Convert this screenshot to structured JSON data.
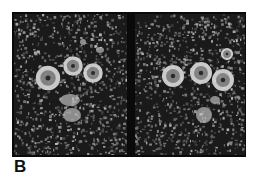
{
  "figure": {
    "panel_label": "B",
    "panels": [
      {
        "id": "left",
        "description": "negative-stain electron micrograph",
        "rings": [
          {
            "cx": 34,
            "cy": 64,
            "r": 10
          },
          {
            "cx": 59,
            "cy": 52,
            "r": 8
          },
          {
            "cx": 79,
            "cy": 59,
            "r": 8
          }
        ],
        "blobs": [
          {
            "cx": 58,
            "cy": 101,
            "rx": 9,
            "ry": 7
          },
          {
            "cx": 56,
            "cy": 86,
            "rx": 10,
            "ry": 6
          },
          {
            "cx": 69,
            "cy": 28,
            "rx": 3,
            "ry": 3
          },
          {
            "cx": 86,
            "cy": 36,
            "rx": 4,
            "ry": 3
          }
        ]
      },
      {
        "id": "right",
        "description": "negative-stain electron micrograph",
        "rings": [
          {
            "cx": 38,
            "cy": 62,
            "r": 9
          },
          {
            "cx": 66,
            "cy": 59,
            "r": 9
          },
          {
            "cx": 88,
            "cy": 66,
            "r": 9
          },
          {
            "cx": 92,
            "cy": 40,
            "r": 5
          }
        ],
        "blobs": [
          {
            "cx": 69,
            "cy": 101,
            "rx": 8,
            "ry": 8
          },
          {
            "cx": 80,
            "cy": 86,
            "rx": 5,
            "ry": 4
          }
        ]
      }
    ],
    "colors": {
      "frame": "#0a0a0a",
      "background": "#1a1a1a",
      "speckle": "#9a9a9a",
      "particle": "#d8d8d8"
    }
  }
}
